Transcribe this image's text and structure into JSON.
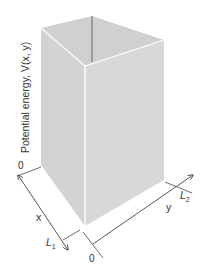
{
  "diagram": {
    "type": "3d-potential-box",
    "vertical_axis_label": "Potential energy, V(x, y)",
    "x_axis": {
      "label": "x",
      "origin_label": "0",
      "end_label": "L",
      "end_subscript": "1"
    },
    "y_axis": {
      "label": "y",
      "origin_label": "0",
      "end_label": "L",
      "end_subscript": "2"
    },
    "colors": {
      "left_face": "#d4d4d4",
      "right_face": "#d9d9d9",
      "top_inner": "#cfcfcf",
      "edge_highlight": "#ffffff",
      "hidden_edge": "#7a7a7a",
      "axis": "#444444",
      "text": "#333333"
    }
  }
}
